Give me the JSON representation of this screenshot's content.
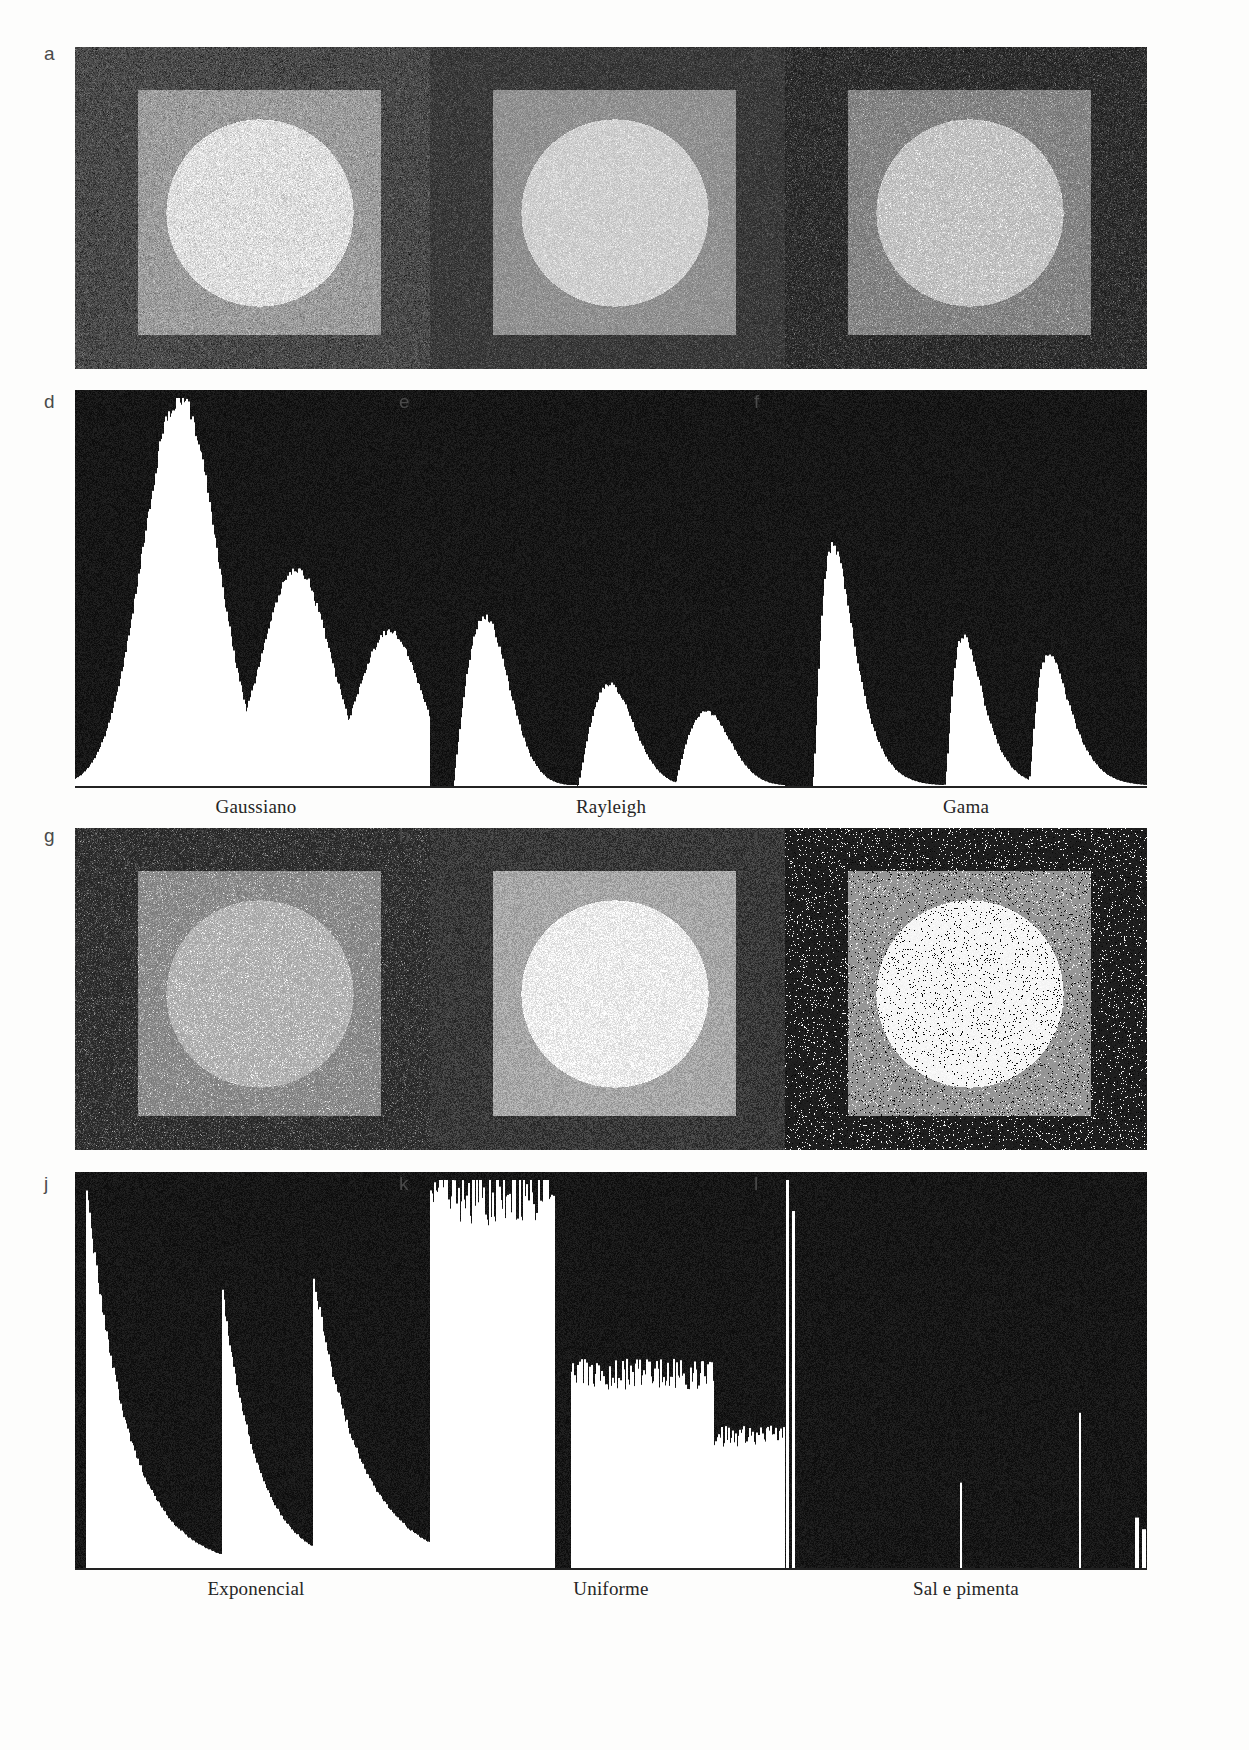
{
  "figure": {
    "running_head": "",
    "panel_labels": [
      "a",
      "b",
      "c",
      "d",
      "e",
      "f",
      "g",
      "h",
      "i",
      "j",
      "k",
      "l"
    ],
    "captions_row1": [
      "Gaussiano",
      "Rayleigh",
      "Gama"
    ],
    "captions_row2": [
      "Exponencial",
      "Uniforme",
      "Sal e pimenta"
    ],
    "colors": {
      "paper": "#fdfdfc",
      "ink": "#262626",
      "label_ink": "#4a4a4a",
      "hist_background": "#111111",
      "hist_bars": "#ffffff",
      "axis": "#222222"
    }
  },
  "test_images": [
    {
      "id": "a",
      "noise": "gaussiano",
      "caption": "Gaussiano",
      "background_gray": 74,
      "square_gray": 156,
      "circle_gray": 222,
      "noise_sigma": 17,
      "noise_type": "gaussian",
      "salt_prob": 0,
      "pepper_prob": 0
    },
    {
      "id": "b",
      "noise": "rayleigh",
      "caption": "Rayleigh",
      "background_gray": 60,
      "square_gray": 146,
      "circle_gray": 208,
      "noise_sigma": 19,
      "noise_type": "rayleigh",
      "salt_prob": 0,
      "pepper_prob": 0
    },
    {
      "id": "c",
      "noise": "gama",
      "caption": "Gama",
      "background_gray": 48,
      "square_gray": 132,
      "circle_gray": 196,
      "noise_sigma": 20,
      "noise_type": "gamma",
      "salt_prob": 0,
      "pepper_prob": 0
    },
    {
      "id": "g",
      "noise": "exponencial",
      "caption": "Exponencial",
      "background_gray": 52,
      "square_gray": 140,
      "circle_gray": 180,
      "noise_sigma": 22,
      "noise_type": "exponential",
      "salt_prob": 0,
      "pepper_prob": 0
    },
    {
      "id": "h",
      "noise": "uniforme",
      "caption": "Uniforme",
      "background_gray": 58,
      "square_gray": 168,
      "circle_gray": 236,
      "noise_sigma": 26,
      "noise_type": "uniform",
      "salt_prob": 0,
      "pepper_prob": 0
    },
    {
      "id": "i",
      "noise": "sal e pimenta",
      "caption": "Sal e pimenta",
      "background_gray": 30,
      "square_gray": 150,
      "circle_gray": 246,
      "noise_sigma": 6,
      "noise_type": "saltpepper",
      "salt_prob": 0.055,
      "pepper_prob": 0.055
    }
  ],
  "chart_data": [
    {
      "id": "d",
      "type": "bar",
      "title": "Gaussiano",
      "xlabel": "",
      "ylabel": "",
      "xlim": [
        0,
        255
      ],
      "ylim": [
        0,
        1
      ],
      "grid": false,
      "legend": "none",
      "bins": 256,
      "description": "Three smooth gaussian lobes, tallest at the dark background level, medium at the square level, smallest at the circle level",
      "peaks": [
        {
          "center": 74,
          "height": 1.0,
          "width": 26,
          "shape": "gaussian"
        },
        {
          "center": 156,
          "height": 0.56,
          "width": 24,
          "shape": "gaussian"
        },
        {
          "center": 222,
          "height": 0.4,
          "width": 22,
          "shape": "gaussian"
        }
      ]
    },
    {
      "id": "e",
      "type": "bar",
      "title": "Rayleigh",
      "xlabel": "",
      "ylabel": "",
      "xlim": [
        0,
        255
      ],
      "ylim": [
        0,
        1
      ],
      "grid": false,
      "legend": "none",
      "bins": 256,
      "description": "Three right-skewed Rayleigh lobes with abrupt left rise and long right tail",
      "peaks": [
        {
          "center": 44,
          "height": 1.0,
          "width": 30,
          "shape": "rayleigh"
        },
        {
          "center": 132,
          "height": 0.6,
          "width": 30,
          "shape": "rayleigh"
        },
        {
          "center": 200,
          "height": 0.44,
          "width": 30,
          "shape": "rayleigh"
        }
      ]
    },
    {
      "id": "f",
      "type": "bar",
      "title": "Gama",
      "xlabel": "",
      "ylabel": "",
      "xlim": [
        0,
        255
      ],
      "ylim": [
        0,
        1
      ],
      "grid": false,
      "legend": "none",
      "bins": 256,
      "description": "Three gamma lobes, each rising steeply then decaying; tallest lobe at the left near the dark level",
      "peaks": [
        {
          "center": 34,
          "height": 1.0,
          "width": 26,
          "shape": "gamma"
        },
        {
          "center": 126,
          "height": 0.62,
          "width": 24,
          "shape": "gamma"
        },
        {
          "center": 186,
          "height": 0.55,
          "width": 26,
          "shape": "gamma"
        }
      ]
    },
    {
      "id": "j",
      "type": "bar",
      "title": "Exponencial",
      "xlabel": "",
      "ylabel": "",
      "xlim": [
        0,
        255
      ],
      "ylim": [
        0,
        1
      ],
      "grid": false,
      "legend": "none",
      "bins": 256,
      "description": "Three exponential lobes, each starting at full height and decaying to zero",
      "peaks": [
        {
          "center": 8,
          "height": 1.0,
          "width": 46,
          "shape": "exponential"
        },
        {
          "center": 104,
          "height": 0.72,
          "width": 40,
          "shape": "exponential"
        },
        {
          "center": 168,
          "height": 0.76,
          "width": 54,
          "shape": "exponential"
        }
      ]
    },
    {
      "id": "k",
      "type": "bar",
      "title": "Uniforme",
      "xlabel": "",
      "ylabel": "",
      "xlim": [
        0,
        255
      ],
      "ylim": [
        0,
        1
      ],
      "grid": false,
      "legend": "none",
      "bins": 256,
      "description": "Three flat rectangular plateaus of decreasing height with ragged noisy tops",
      "peaks": [
        {
          "center": 32,
          "height": 0.96,
          "width": 56,
          "shape": "uniform"
        },
        {
          "center": 150,
          "height": 0.5,
          "width": 50,
          "shape": "uniform"
        },
        {
          "center": 218,
          "height": 0.34,
          "width": 40,
          "shape": "uniform"
        }
      ]
    },
    {
      "id": "l",
      "type": "bar",
      "title": "Sal e pimenta",
      "xlabel": "",
      "ylabel": "",
      "xlim": [
        0,
        255
      ],
      "ylim": [
        0,
        1
      ],
      "grid": false,
      "legend": "none",
      "bins": 256,
      "description": "Nearly empty histogram with isolated narrow impulse lines at the three image levels plus tall spikes at 0 and 255",
      "peaks": [
        {
          "center": 2,
          "height": 1.0,
          "width": 1,
          "shape": "impulse"
        },
        {
          "center": 6,
          "height": 0.92,
          "width": 1,
          "shape": "impulse"
        },
        {
          "center": 124,
          "height": 0.22,
          "width": 1,
          "shape": "impulse"
        },
        {
          "center": 208,
          "height": 0.4,
          "width": 1,
          "shape": "impulse"
        },
        {
          "center": 248,
          "height": 0.13,
          "width": 1,
          "shape": "impulse"
        },
        {
          "center": 253,
          "height": 0.1,
          "width": 1,
          "shape": "impulse"
        }
      ]
    }
  ],
  "layout": {
    "columns_x": [
      75,
      430,
      785
    ],
    "panel_width": 362,
    "image_row1_y": 47,
    "image_row2_y": 828,
    "image_height": 322,
    "hist_row1_y": 390,
    "hist_row2_y": 1172,
    "hist_height": 396,
    "caption_row1_y": 795,
    "caption_row2_y": 1578
  }
}
